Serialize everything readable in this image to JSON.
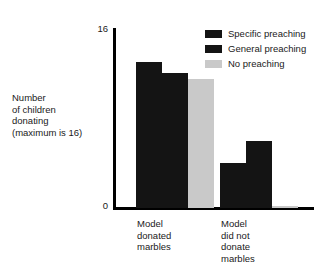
{
  "chart_data": {
    "type": "bar",
    "title": "",
    "xlabel": "",
    "ylabel": "Number\nof children\ndonating\n(maximum is 16)",
    "ylim": [
      0,
      16
    ],
    "yticks": [
      0,
      16
    ],
    "ytick_labels": [
      "0",
      "16"
    ],
    "grid": false,
    "legend_position": "top-right",
    "categories": [
      "Model\ndonated\nmarbles",
      "Model\ndid not\ndonate\nmarbles"
    ],
    "series": [
      {
        "name": "Specific preaching",
        "color": "#141414",
        "values": [
          13,
          4
        ]
      },
      {
        "name": "General preaching",
        "color": "#141414",
        "values": [
          12,
          6
        ]
      },
      {
        "name": "No preaching",
        "color": "#c9c9c9",
        "values": [
          11.5,
          0.2
        ]
      }
    ]
  },
  "axis": {
    "top_tick": "16",
    "bottom_tick": "0",
    "axis_color": "#000000"
  },
  "legend": {
    "items": [
      {
        "label": "Specific preaching",
        "color": "#141414"
      },
      {
        "label": "General preaching",
        "color": "#141414"
      },
      {
        "label": "No preaching",
        "color": "#c9c9c9"
      }
    ]
  }
}
